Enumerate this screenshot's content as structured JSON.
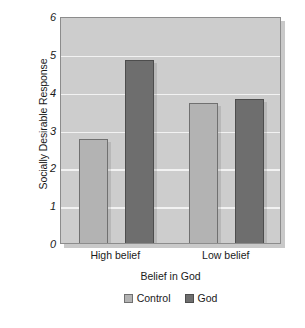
{
  "chart_data": {
    "type": "bar",
    "title": "",
    "xlabel": "Belief in God",
    "ylabel": "Socially Desirable Response",
    "categories": [
      "High belief",
      "Low belief"
    ],
    "series": [
      {
        "name": "Control",
        "values": [
          2.8,
          3.75
        ],
        "color": "#b3b3b3"
      },
      {
        "name": "God",
        "values": [
          4.9,
          3.85
        ],
        "color": "#6e6e6e"
      }
    ],
    "ylim": [
      0,
      6
    ],
    "yticks": [
      0,
      1,
      2,
      3,
      4,
      5,
      6
    ],
    "ytick_labels": [
      "0",
      "1",
      "2",
      "3",
      "4",
      "5",
      "6"
    ],
    "grid": true,
    "grid_axis": "y",
    "legend_position": "bottom",
    "plot_background": "#cdcdcd",
    "gridline_color": "#f2f2f2"
  },
  "axes": {
    "y_title": "Socially Desirable Response",
    "x_title": "Belief in God"
  },
  "legend": {
    "entries": [
      {
        "label": "Control",
        "swatch": "legend-swatch-control"
      },
      {
        "label": "God",
        "swatch": "legend-swatch-god"
      }
    ]
  }
}
